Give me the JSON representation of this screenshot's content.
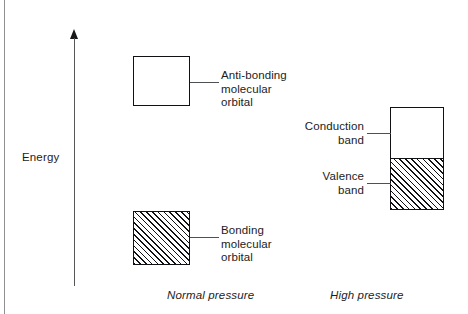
{
  "figure": {
    "axis": {
      "label": "Energy",
      "direction": "up",
      "arrow_icon": "up-arrow-icon"
    },
    "levels": [
      {
        "id": "antibonding",
        "label": "Anti-bonding\nmolecular\norbital",
        "fill": "empty",
        "group": "normal_pressure"
      },
      {
        "id": "bonding",
        "label": "Bonding\nmolecular\norbital",
        "fill": "hatched",
        "group": "normal_pressure"
      },
      {
        "id": "conduction",
        "label": "Conduction\nband",
        "fill": "empty",
        "group": "high_pressure"
      },
      {
        "id": "valence",
        "label": "Valence\nband",
        "fill": "hatched",
        "group": "high_pressure"
      }
    ],
    "captions": {
      "normal_pressure": "Normal pressure",
      "high_pressure": "High pressure"
    },
    "colors": {
      "ink": "#101114",
      "leader": "#4e5054",
      "frame": "#8f9094",
      "background": "#ffffff"
    }
  }
}
